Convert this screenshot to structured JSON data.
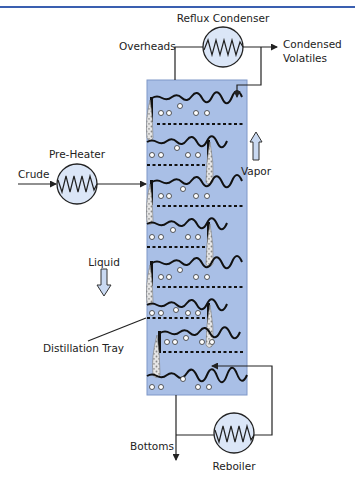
{
  "diagram": {
    "type": "distillation-column-process",
    "colors": {
      "header_rule": "#3a5fb0",
      "column_fill": "#a9bfe6",
      "column_stroke": "#7f97c8",
      "exchanger_fill": "#dbe6f7",
      "arrow_fill": "#c9d9f2",
      "line": "#222222"
    },
    "labels": {
      "reflux_condenser": "Reflux Condenser",
      "overheads": "Overheads",
      "condensed_volatiles_line1": "Condensed",
      "condensed_volatiles_line2": "Volatiles",
      "pre_heater": "Pre-Heater",
      "crude": "Crude",
      "vapor": "Vapor",
      "liquid": "Liquid",
      "distillation_tray": "Distillation Tray",
      "bottoms": "Bottoms",
      "reboiler": "Reboiler"
    },
    "components": [
      {
        "name": "Reflux Condenser",
        "kind": "heat-exchanger"
      },
      {
        "name": "Pre-Heater",
        "kind": "heat-exchanger"
      },
      {
        "name": "Reboiler",
        "kind": "heat-exchanger"
      },
      {
        "name": "Distillation Column",
        "kind": "column",
        "trays": 7
      }
    ],
    "streams": [
      {
        "from": "Crude",
        "to": "Pre-Heater"
      },
      {
        "from": "Pre-Heater",
        "to": "Distillation Column"
      },
      {
        "from": "Distillation Column",
        "to": "Reflux Condenser",
        "label": "Overheads"
      },
      {
        "from": "Reflux Condenser",
        "to": "Condensed Volatiles"
      },
      {
        "from": "Reflux Condenser",
        "to": "Distillation Column",
        "label": "Reflux"
      },
      {
        "from": "Distillation Column",
        "to": "Bottoms"
      },
      {
        "from": "Distillation Column",
        "to": "Reboiler"
      },
      {
        "from": "Reboiler",
        "to": "Distillation Column"
      }
    ]
  }
}
